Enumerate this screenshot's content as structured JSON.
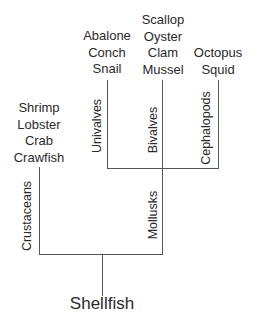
{
  "root": {
    "label": "Shellfish"
  },
  "branches": [
    {
      "label": "Crustaceans",
      "items": [
        "Shrimp",
        "Lobster",
        "Crab",
        "Crawfish"
      ]
    },
    {
      "label": "Mollusks",
      "children": [
        {
          "label": "Univalves",
          "items": [
            "Abalone",
            "Conch",
            "Snail"
          ]
        },
        {
          "label": "Bivalves",
          "items": [
            "Scallop",
            "Oyster",
            "Clam",
            "Mussel"
          ]
        },
        {
          "label": "Cephalopods",
          "items": [
            "Octopus",
            "Squid"
          ]
        }
      ]
    }
  ]
}
